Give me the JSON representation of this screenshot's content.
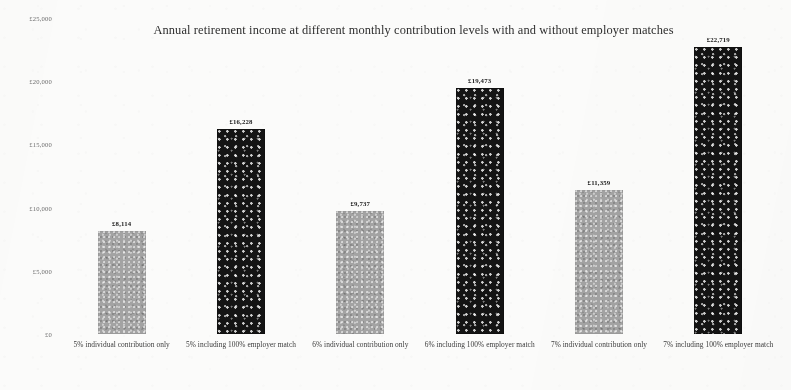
{
  "chart_data": {
    "type": "bar",
    "title": "Annual retirement income at different monthly contribution levels with and without employer matches",
    "xlabel": "",
    "ylabel": "",
    "ylim": [
      0,
      25000
    ],
    "grid": false,
    "legend": "none",
    "currency_symbol": "£",
    "ytick_labels": [
      "£25,000",
      "£20,000",
      "£15,000",
      "£10,000",
      "£5,000",
      "£0"
    ],
    "ytick_values": [
      25000,
      20000,
      15000,
      10000,
      5000,
      0
    ],
    "categories": [
      "5% individual contribution only",
      "5% including 100% employer match",
      "6% individual contribution only",
      "6% including 100% employer match",
      "7% individual contribution only",
      "7% including 100% employer match"
    ],
    "values": [
      8114,
      16228,
      9737,
      19473,
      11359,
      22719
    ],
    "value_labels": [
      "£8,114",
      "£16,228",
      "£9,737",
      "£19,473",
      "£11,359",
      "£22,719"
    ],
    "bar_styles": [
      "gray",
      "dark",
      "gray",
      "dark",
      "gray",
      "dark"
    ],
    "colors": {
      "bar_individual": "#a3a3a3",
      "bar_employer_match": "#141414",
      "background": "#fbfbfa",
      "text": "#2e2e2e"
    }
  }
}
